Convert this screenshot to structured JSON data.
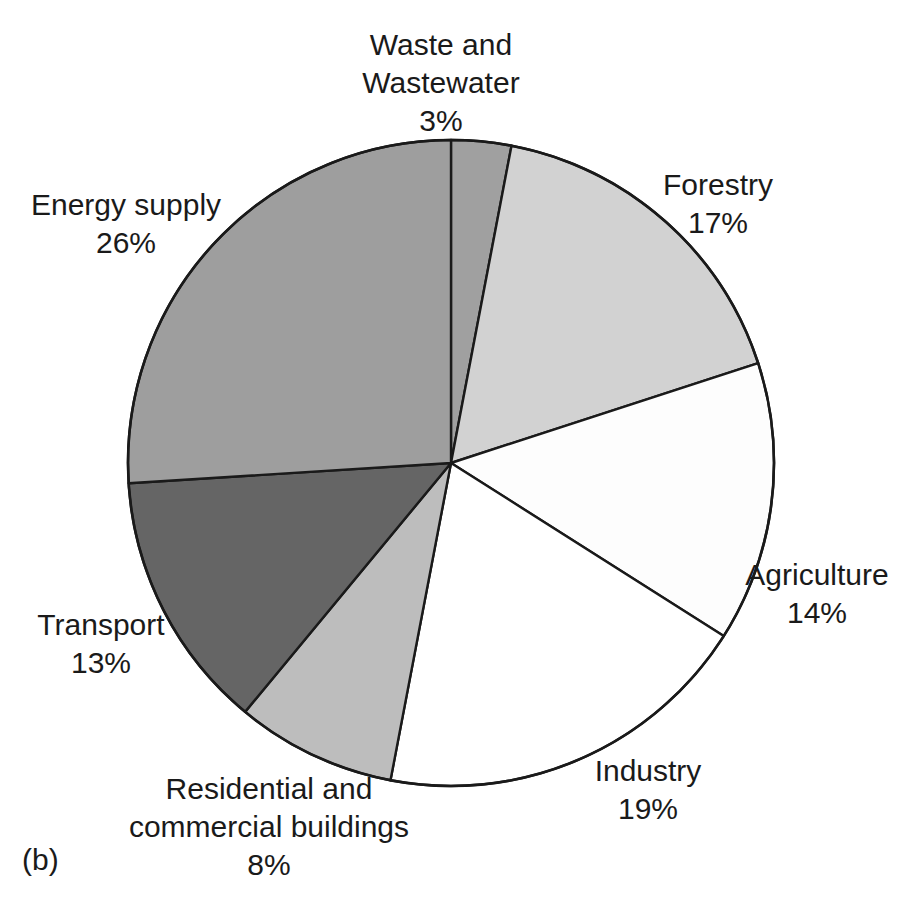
{
  "figure": {
    "caption": "(b)",
    "background_color": "#ffffff",
    "text_color": "#1a1a1a",
    "outline_color": "#1a1a1a"
  },
  "chart_data": {
    "type": "pie",
    "title": "",
    "subtitle": "",
    "xlabel": "",
    "ylabel": "",
    "legend_position": "none",
    "grid": false,
    "start_angle_deg": 0,
    "direction": "clockwise",
    "center": {
      "x": 451,
      "y": 463
    },
    "radius": 323,
    "units": "percent",
    "total": 100,
    "categories": [
      "Waste and Wastewater",
      "Forestry",
      "Agriculture",
      "Industry",
      "Residential and commercial buildings",
      "Transport",
      "Energy supply"
    ],
    "values": [
      3,
      17,
      14,
      19,
      8,
      13,
      26
    ],
    "slices": [
      {
        "label": "Waste and Wastewater",
        "label_lines": [
          "Waste and",
          "Wastewater"
        ],
        "value": 3,
        "value_text": "3%",
        "color": "#a0a0a0",
        "start_deg": 0,
        "end_deg": 10.8
      },
      {
        "label": "Forestry",
        "label_lines": [
          "Forestry"
        ],
        "value": 17,
        "value_text": "17%",
        "color": "#d2d2d2",
        "start_deg": 10.8,
        "end_deg": 72.0
      },
      {
        "label": "Agriculture",
        "label_lines": [
          "Agriculture"
        ],
        "value": 14,
        "value_text": "14%",
        "color": "#fdfdfd",
        "start_deg": 72.0,
        "end_deg": 122.4
      },
      {
        "label": "Industry",
        "label_lines": [
          "Industry"
        ],
        "value": 19,
        "value_text": "19%",
        "color": "#ffffff",
        "start_deg": 122.4,
        "end_deg": 190.8
      },
      {
        "label": "Residential and commercial buildings",
        "label_lines": [
          "Residential and",
          "commercial buildings"
        ],
        "value": 8,
        "value_text": "8%",
        "color": "#bdbdbd",
        "start_deg": 190.8,
        "end_deg": 219.6
      },
      {
        "label": "Transport",
        "label_lines": [
          "Transport"
        ],
        "value": 13,
        "value_text": "13%",
        "color": "#656565",
        "start_deg": 219.6,
        "end_deg": 266.4
      },
      {
        "label": "Energy supply",
        "label_lines": [
          "Energy supply"
        ],
        "value": 26,
        "value_text": "26%",
        "color": "#9e9e9e",
        "start_deg": 266.4,
        "end_deg": 360.0
      }
    ]
  },
  "labels": {
    "waste": {
      "line1": "Waste and",
      "line2": "Wastewater",
      "value": "3%"
    },
    "forestry": {
      "line1": "Forestry",
      "value": "17%"
    },
    "agriculture": {
      "line1": "Agriculture",
      "value": "14%"
    },
    "industry": {
      "line1": "Industry",
      "value": "19%"
    },
    "residential": {
      "line1": "Residential and",
      "line2": "commercial buildings",
      "value": "8%"
    },
    "transport": {
      "line1": "Transport",
      "value": "13%"
    },
    "energy": {
      "line1": "Energy supply",
      "value": "26%"
    }
  }
}
